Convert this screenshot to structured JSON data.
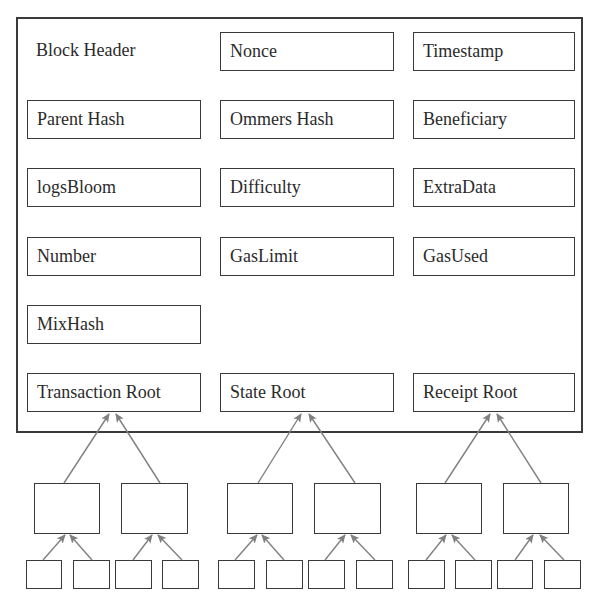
{
  "diagram": {
    "title": "Block Header",
    "fields": [
      {
        "id": "nonce",
        "label": "Nonce"
      },
      {
        "id": "timestamp",
        "label": "Timestamp"
      },
      {
        "id": "parent-hash",
        "label": "Parent Hash"
      },
      {
        "id": "ommers-hash",
        "label": "Ommers Hash"
      },
      {
        "id": "beneficiary",
        "label": "Beneficiary"
      },
      {
        "id": "logs-bloom",
        "label": "logsBloom"
      },
      {
        "id": "difficulty",
        "label": "Difficulty"
      },
      {
        "id": "extra-data",
        "label": "ExtraData"
      },
      {
        "id": "number",
        "label": "Number"
      },
      {
        "id": "gas-limit",
        "label": "GasLimit"
      },
      {
        "id": "gas-used",
        "label": "GasUsed"
      },
      {
        "id": "mix-hash",
        "label": "MixHash"
      }
    ],
    "roots": [
      {
        "id": "transaction-root",
        "label": "Transaction Root"
      },
      {
        "id": "state-root",
        "label": "State Root"
      },
      {
        "id": "receipt-root",
        "label": "Receipt Root"
      }
    ],
    "trees": {
      "count": 3,
      "intermediate_nodes_per_tree": 2,
      "leaf_nodes_per_intermediate": 2
    },
    "colors": {
      "border": "#3a3a3a",
      "arrow": "#808080",
      "text": "#2b2b2b",
      "background": "#ffffff"
    }
  }
}
